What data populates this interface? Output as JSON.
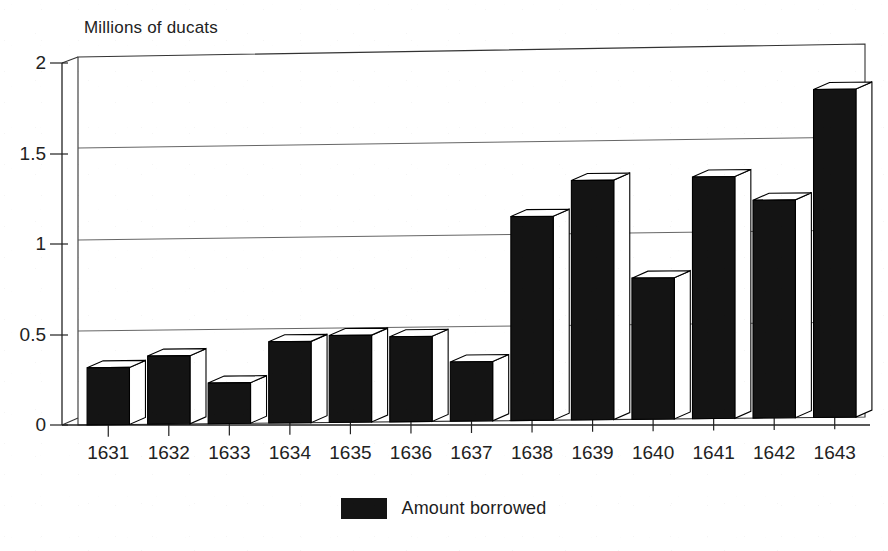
{
  "chart_data": {
    "type": "bar",
    "title": "",
    "subtitle": "",
    "xlabel": "",
    "ylabel": "Millions of ducats",
    "ylim": [
      0,
      2
    ],
    "yticks": [
      "0",
      "0.5",
      "1",
      "1.5",
      "2"
    ],
    "ytick_values": [
      0,
      0.5,
      1,
      1.5,
      2
    ],
    "grid": true,
    "grid_axis": "y",
    "style": "3d-bar",
    "legend_position": "bottom-center",
    "categories": [
      "1631",
      "1632",
      "1633",
      "1634",
      "1635",
      "1636",
      "1637",
      "1638",
      "1639",
      "1640",
      "1641",
      "1642",
      "1643"
    ],
    "series": [
      {
        "name": "Amount borrowed",
        "color": "#141414",
        "values": [
          0.31,
          0.37,
          0.22,
          0.44,
          0.47,
          0.46,
          0.32,
          1.1,
          1.29,
          0.76,
          1.3,
          1.17,
          1.76
        ]
      }
    ]
  },
  "axis": {
    "y_title": "Millions of ducats",
    "tick_labels_y": [
      "2",
      "1.5",
      "1",
      "0.5",
      "0"
    ],
    "tick_labels_x": [
      "1631",
      "1632",
      "1633",
      "1634",
      "1635",
      "1636",
      "1637",
      "1638",
      "1639",
      "1640",
      "1641",
      "1642",
      "1643"
    ]
  },
  "legend": {
    "entries": [
      {
        "label": "Amount borrowed",
        "color": "#141414"
      }
    ]
  },
  "colors": {
    "bar_front": "#141414",
    "bar_top": "#ffffff",
    "bar_side": "#ffffff",
    "outline": "#000000",
    "gridline": "#555555",
    "background": "#ffffff",
    "text": "#1a1a1a"
  }
}
